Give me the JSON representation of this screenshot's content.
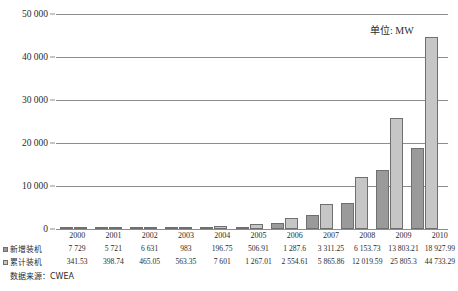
{
  "chart_data": {
    "type": "bar",
    "title": "",
    "subtitle": "",
    "annotation": "单位: MW",
    "xlabel": "",
    "ylabel": "",
    "ylim": [
      0,
      50000
    ],
    "yticks": [
      0,
      10000,
      20000,
      30000,
      40000,
      50000
    ],
    "ytick_labels": [
      "0",
      "10 000",
      "20 000",
      "30 000",
      "40 000",
      "50 000"
    ],
    "grid": true,
    "legend_position": "table-left",
    "categories": [
      "2000",
      "2001",
      "2002",
      "2003",
      "2004",
      "2005",
      "2006",
      "2007",
      "2008",
      "2009",
      "2010"
    ],
    "series": [
      {
        "name": "新增装机",
        "color": "#9a9a9a",
        "values": [
          77.29,
          57.21,
          66.31,
          98.3,
          196.75,
          506.91,
          1287.6,
          3311.25,
          6153.73,
          13803.21,
          18927.99
        ],
        "labels": [
          "7 729",
          "5 721",
          "6 631",
          "983",
          "196.75",
          "506.91",
          "1 287.6",
          "3 311.25",
          "6 153.73",
          "13 803.21",
          "18 927.99"
        ]
      },
      {
        "name": "累计装机",
        "color": "#c6c6c6",
        "values": [
          341.53,
          398.74,
          465.05,
          563.35,
          760.1,
          1267.01,
          2554.61,
          5865.86,
          12019.59,
          25805.3,
          44733.29
        ],
        "labels": [
          "341.53",
          "398.74",
          "465.05",
          "563.35",
          "7 601",
          "1 267.01",
          "2 554.61",
          "5 865.86",
          "12 019.59",
          "25 805.3",
          "44 733.29"
        ]
      }
    ],
    "source": "数据来源：CWEA"
  },
  "axis": {
    "tick_0": "0",
    "tick_1": "10 000",
    "tick_2": "20 000",
    "tick_3": "30 000",
    "tick_4": "40 000",
    "tick_5": "50 000"
  },
  "unit_note": "单位: MW",
  "table": {
    "years": [
      "2000",
      "2001",
      "2002",
      "2003",
      "2004",
      "2005",
      "2006",
      "2007",
      "2008",
      "2009",
      "2010"
    ],
    "row_new_label": "新增装机",
    "row_cum_label": "累计装机",
    "row_new_values": [
      "7 729",
      "5 721",
      "6 631",
      "983",
      "196.75",
      "506.91",
      "1 287.6",
      "3 311.25",
      "6 153.73",
      "13 803.21",
      "18 927.99"
    ],
    "row_cum_values": [
      "341.53",
      "398.74",
      "465.05",
      "563.35",
      "7 601",
      "1 267.01",
      "2 554.61",
      "5 865.86",
      "12 019.59",
      "25 805.3",
      "44 733.29"
    ],
    "corner_blank": ""
  },
  "source_note": "数据来源：CWEA",
  "colors": {
    "series_new": "#9a9a9a",
    "series_cum": "#c6c6c6",
    "grid": "#8d8d8d",
    "text": "#2b2b2b"
  }
}
